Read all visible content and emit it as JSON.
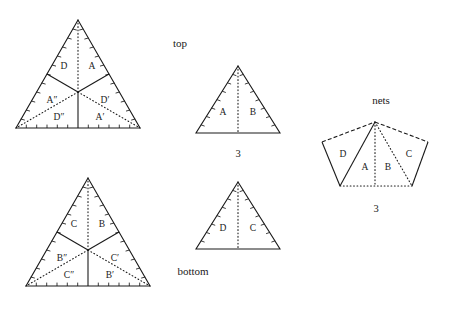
{
  "figure": {
    "title": "",
    "background_color": "#ffffff",
    "line_color": "#1a1a1a",
    "captions": {
      "top": "top",
      "bottom": "bottom",
      "nets": "nets"
    },
    "numbers": {
      "middle_top": "3",
      "nets": "3"
    }
  },
  "panels": {
    "top_left": {
      "name": "top-face-subdivided-triangle",
      "caption": "top",
      "region_labels": [
        "D",
        "A",
        "A″",
        "D′",
        "D″",
        "A′"
      ],
      "labels": {
        "upper_left": "D",
        "upper_right": "A",
        "mid_left": "A″",
        "mid_right": "D′",
        "lower_left": "D″",
        "lower_right": "A′"
      }
    },
    "bottom_left": {
      "name": "bottom-face-subdivided-triangle",
      "caption": "bottom",
      "region_labels": [
        "C",
        "B",
        "B″",
        "C′",
        "C″",
        "B′"
      ],
      "labels": {
        "upper_left": "C",
        "upper_right": "B",
        "mid_left": "B″",
        "mid_right": "C′",
        "lower_left": "C″",
        "lower_right": "B′"
      }
    },
    "middle_top": {
      "name": "side-face-triangle-ab",
      "number": "3",
      "labels": {
        "left": "A",
        "right": "B"
      }
    },
    "middle_bottom": {
      "name": "side-face-triangle-dc",
      "labels": {
        "left": "D",
        "right": "C"
      }
    },
    "nets": {
      "name": "net-fan-diagram",
      "caption": "nets",
      "number": "3",
      "labels": {
        "far_left": "D",
        "left": "A",
        "right": "B",
        "far_right": "C"
      }
    }
  }
}
